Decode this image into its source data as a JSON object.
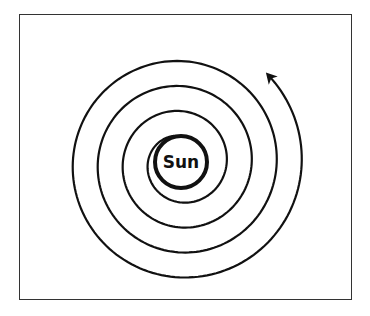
{
  "diagram": {
    "type": "spiral",
    "center_label": "Sun",
    "direction": "counterclockwise",
    "turns": 4,
    "has_arrow": true,
    "colors": {
      "stroke": "#111111",
      "frame": "#333333",
      "background": "#ffffff"
    }
  },
  "geometry": {
    "frame": {
      "x": 19,
      "y": 14,
      "w": 333,
      "h": 286
    },
    "sun": {
      "cx": 181,
      "cy": 162,
      "r": 26,
      "stroke_width": 4
    },
    "spiral": {
      "cx": 181,
      "cy": 163,
      "start_angle_deg": -105,
      "start_r": 28,
      "growth_per_turn": 25,
      "total_deg": 1380,
      "stroke_width": 2.2
    },
    "arrow_tip": {
      "x": 171,
      "y": 38
    }
  }
}
